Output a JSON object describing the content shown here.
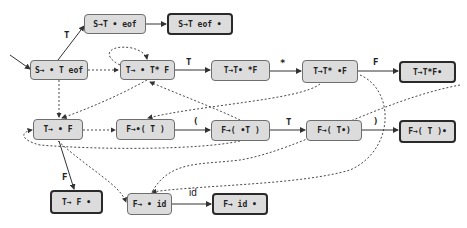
{
  "diagram": {
    "type": "LR(0) automaton",
    "states": [
      {
        "id": "s0",
        "label": "S→ • T eof",
        "final": false
      },
      {
        "id": "s1",
        "label": "S→T • eof",
        "final": false
      },
      {
        "id": "s2",
        "label": "S→T eof •",
        "final": true
      },
      {
        "id": "s3",
        "label": "T→ • T* F",
        "final": false
      },
      {
        "id": "s4",
        "label": "T→T• *F",
        "final": false
      },
      {
        "id": "s5",
        "label": "T→T* •F",
        "final": false
      },
      {
        "id": "s6",
        "label": "T→T*F•",
        "final": true
      },
      {
        "id": "s7",
        "label": "T→ • F",
        "final": false
      },
      {
        "id": "s8",
        "label": "F→•( T )",
        "final": false
      },
      {
        "id": "s9",
        "label": "F→( •T )",
        "final": false
      },
      {
        "id": "s10",
        "label": "F→( T•)",
        "final": false
      },
      {
        "id": "s11",
        "label": "F→( T )•",
        "final": true
      },
      {
        "id": "s12",
        "label": "T→ F •",
        "final": true
      },
      {
        "id": "s13",
        "label": "F→ • id",
        "final": false
      },
      {
        "id": "s14",
        "label": "F→ id •",
        "final": true
      }
    ],
    "edge_labels": {
      "s0_s1": "T",
      "s3_s4": "T",
      "s4_s5": "*",
      "s5_s6": "F",
      "s8_s9": "(",
      "s9_s10": "T",
      "s10_s11": ")",
      "s7_s12": "F",
      "s13_s14": "id"
    },
    "colors": {
      "node_fill": "#dcdcdc",
      "node_border": "#6e6e6e",
      "final_border": "#2a2a2a",
      "edge": "#333333"
    }
  }
}
